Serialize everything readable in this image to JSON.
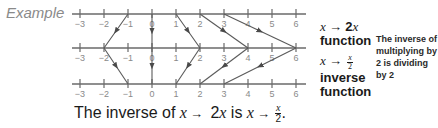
{
  "example_label": "Example",
  "number_lines": {
    "tick_values": [
      "−3",
      "−2",
      "−1",
      "0",
      "1",
      "2",
      "3",
      "4",
      "5",
      "6"
    ],
    "line_positions_y": [
      14,
      48,
      84
    ],
    "tick_x": [
      80,
      104,
      128,
      152,
      176,
      200,
      224,
      248,
      272,
      296
    ]
  },
  "mappings": {
    "function": {
      "rule": "x → 2x",
      "pairs": [
        [
          -1,
          -2
        ],
        [
          0,
          0
        ],
        [
          1,
          2
        ],
        [
          2,
          4
        ],
        [
          3,
          6
        ]
      ]
    },
    "inverse": {
      "rule": "x → x/2",
      "pairs": [
        [
          -2,
          -1
        ],
        [
          0,
          0
        ],
        [
          2,
          1
        ],
        [
          4,
          2
        ],
        [
          6,
          3
        ]
      ]
    }
  },
  "labels": {
    "function": {
      "var": "x",
      "arrow": "→",
      "expr_num": "2",
      "expr_var": "x",
      "word": "function"
    },
    "inverse": {
      "var": "x",
      "arrow": "→",
      "frac_num": "x",
      "frac_den": "2",
      "word1": "inverse",
      "word2": "function"
    }
  },
  "side_note": "The inverse of multiplying by 2 is dividing by 2",
  "caption": {
    "prefix": "The inverse of ",
    "var1": "x",
    "arrow1": "→",
    "expr": " 2",
    "var2": "x",
    "middle": " is ",
    "var3": "x",
    "arrow2": "→",
    "frac_num": "x",
    "frac_den": "2",
    "suffix": "."
  }
}
